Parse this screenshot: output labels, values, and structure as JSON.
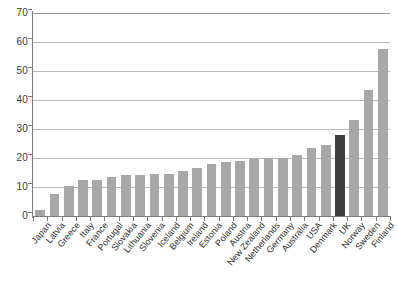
{
  "chart_data": {
    "type": "bar",
    "title": "",
    "subtitle": "",
    "xlabel": "",
    "ylabel": "",
    "ylim": [
      0,
      70
    ],
    "yticks": [
      0,
      10,
      20,
      30,
      40,
      50,
      60,
      70
    ],
    "grid": true,
    "legend": "none",
    "highlight_category": "UK",
    "colors": {
      "bar": "#a8a8a8",
      "bar_highlight": "#404040",
      "gridline": "#b9b9b9",
      "axis": "#7d7d7d",
      "background": "#ffffff",
      "text": "#2e2e2e"
    },
    "categories": [
      "Japan",
      "Latvia",
      "Greece",
      "Italy",
      "France",
      "Portugal",
      "Slovakia",
      "Lithuania",
      "Slovenia",
      "Iceland",
      "Belgium",
      "Ireland",
      "Estonia",
      "Poland",
      "Austria",
      "New Zealand",
      "Netherlands",
      "Germany",
      "Australia",
      "USA",
      "Denmark",
      "UK",
      "Norway",
      "Sweden",
      "Finland"
    ],
    "values": [
      2,
      7.5,
      10.5,
      12.5,
      12.5,
      13.5,
      14,
      14,
      14.5,
      14.5,
      15.5,
      16.5,
      18,
      18.5,
      19,
      19.5,
      20,
      20,
      21,
      23.5,
      24.5,
      28,
      33,
      43.5,
      57.5
    ]
  }
}
